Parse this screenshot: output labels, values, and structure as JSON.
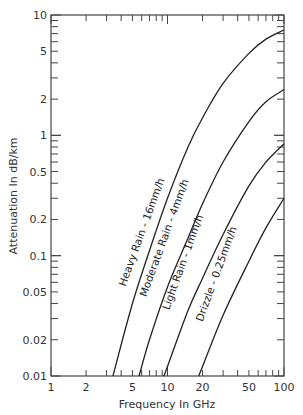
{
  "chart_data": {
    "type": "line",
    "title": "",
    "xlabel": "Frequency In GHz",
    "ylabel": "Attenuation In dB/km",
    "xscale": "log",
    "yscale": "log",
    "xlim": [
      1,
      100
    ],
    "ylim": [
      0.01,
      10
    ],
    "x_ticks": [
      "1",
      "2",
      "5",
      "10",
      "20",
      "50",
      "100"
    ],
    "x_tick_values": [
      1,
      2,
      5,
      10,
      20,
      50,
      100
    ],
    "y_ticks": [
      "0.01",
      "0.02",
      "0.05",
      "0.1",
      "0.2",
      "0.5",
      "1",
      "2",
      "5",
      "10"
    ],
    "y_tick_values": [
      0.01,
      0.02,
      0.05,
      0.1,
      0.2,
      0.5,
      1,
      2,
      5,
      10
    ],
    "grid": false,
    "legend": "inline labels along curves",
    "series": [
      {
        "name": "Heavy Rain - 16mm/h",
        "x": [
          3.4,
          5,
          7,
          10,
          15,
          20,
          30,
          50,
          70,
          100
        ],
        "y": [
          0.01,
          0.04,
          0.11,
          0.3,
          0.8,
          1.4,
          2.7,
          4.8,
          6.3,
          7.5
        ]
      },
      {
        "name": "Moderate Rain - 4mm/h",
        "x": [
          5.7,
          7,
          10,
          15,
          20,
          30,
          50,
          70,
          100
        ],
        "y": [
          0.01,
          0.02,
          0.055,
          0.14,
          0.27,
          0.6,
          1.3,
          1.9,
          2.4
        ]
      },
      {
        "name": "Light Rain - 1mm/h",
        "x": [
          9.3,
          10,
          15,
          20,
          30,
          50,
          70,
          100
        ],
        "y": [
          0.01,
          0.012,
          0.035,
          0.065,
          0.15,
          0.38,
          0.6,
          0.85
        ]
      },
      {
        "name": "Drizzle - 0.25mm/h",
        "x": [
          18.5,
          20,
          30,
          50,
          70,
          100
        ],
        "y": [
          0.01,
          0.012,
          0.032,
          0.09,
          0.17,
          0.3
        ]
      }
    ]
  }
}
